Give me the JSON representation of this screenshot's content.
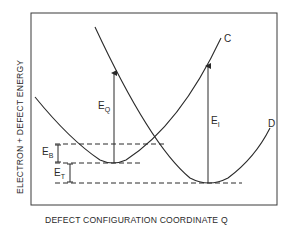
{
  "diagram": {
    "type": "configuration-coordinate-diagram",
    "y_axis_label": "ELECTRON + DEFECT ENERGY",
    "x_axis_label": "DEFECT CONFIGURATION COORDINATE Q",
    "curves": [
      {
        "id": "C",
        "label": "C",
        "description": "ground-state parabola, minimum left, rising to upper right"
      },
      {
        "id": "D",
        "label": "D",
        "description": "shifted parabola, minimum lower right"
      }
    ],
    "energies": [
      {
        "id": "EQ",
        "main": "E",
        "sub": "Q",
        "description": "vertical transition from minimum of C"
      },
      {
        "id": "EI",
        "main": "E",
        "sub": "I",
        "description": "vertical transition from minimum of D"
      },
      {
        "id": "EB",
        "main": "E",
        "sub": "B",
        "description": "barrier energy between crossing and C minimum"
      },
      {
        "id": "ET",
        "main": "E",
        "sub": "T",
        "description": "thermal energy between C minimum and D minimum"
      }
    ],
    "colors": {
      "line": "#2a2a2a",
      "background": "#ffffff"
    }
  }
}
